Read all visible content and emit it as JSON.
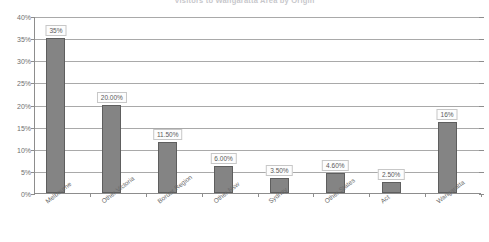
{
  "chart_data": {
    "type": "bar",
    "title": "Visitors to Wangaratta Area by Origin",
    "xlabel": "",
    "ylabel": "",
    "ylim": [
      0,
      40
    ],
    "ytick_labels": [
      "0%",
      "5%",
      "10%",
      "15%",
      "20%",
      "25%",
      "30%",
      "35%",
      "40%"
    ],
    "ytick_values": [
      0,
      5,
      10,
      15,
      20,
      25,
      30,
      35,
      40
    ],
    "grid": true,
    "legend": "none",
    "categories": [
      "Melbourne",
      "Other Victoria",
      "Border Region",
      "Other Nsw",
      "Sydney",
      "Other States",
      "Act",
      "Wangaratta"
    ],
    "values": [
      35,
      20,
      11.5,
      6,
      3.5,
      4.6,
      2.5,
      16
    ],
    "data_labels": [
      "35%",
      "20.00%",
      "11.50%",
      "6.00%",
      "3.50%",
      "4.60%",
      "2.50%",
      "16%"
    ],
    "bar_color": "#848484",
    "bar_border_color": "#5e5e5e",
    "gridline_color": "#a9a9a9",
    "axis_color": "#8d8d8d"
  }
}
